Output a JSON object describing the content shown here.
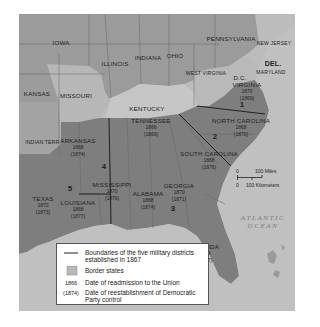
{
  "map": {
    "title": "Reconstruction military districts",
    "states": [
      {
        "name": "IOWA",
        "type": "union"
      },
      {
        "name": "ILLINOIS",
        "type": "union"
      },
      {
        "name": "INDIANA",
        "type": "union"
      },
      {
        "name": "OHIO",
        "type": "union"
      },
      {
        "name": "PENNSYLVANIA",
        "type": "union"
      },
      {
        "name": "NEW JERSEY",
        "type": "union"
      },
      {
        "name": "KANSAS",
        "type": "union"
      },
      {
        "name": "INDIAN TERR.",
        "type": "territory"
      },
      {
        "name": "MISSOURI",
        "type": "border"
      },
      {
        "name": "KENTUCKY",
        "type": "border"
      },
      {
        "name": "WEST VIRGINIA",
        "type": "border"
      },
      {
        "name": "MARYLAND",
        "type": "border"
      },
      {
        "name": "DEL.",
        "type": "border"
      },
      {
        "name": "D.C.",
        "type": "border"
      },
      {
        "name": "VIRGINIA",
        "type": "confederate",
        "readmitted": "1870",
        "democratic_control": "(1869)"
      },
      {
        "name": "NORTH CAROLINA",
        "type": "confederate",
        "readmitted": "1868",
        "democratic_control": "(1870)"
      },
      {
        "name": "SOUTH CAROLINA",
        "type": "confederate",
        "readmitted": "1868",
        "democratic_control": "(1876)"
      },
      {
        "name": "GEORGIA",
        "type": "confederate",
        "readmitted": "1870",
        "democratic_control": "(1871)"
      },
      {
        "name": "FLORIDA",
        "type": "confederate",
        "readmitted": "1868",
        "democratic_control": "(1877)"
      },
      {
        "name": "ALABAMA",
        "type": "confederate",
        "readmitted": "1868",
        "democratic_control": "(1874)"
      },
      {
        "name": "MISSISSIPPI",
        "type": "confederate",
        "readmitted": "1870",
        "democratic_control": "(1876)"
      },
      {
        "name": "TENNESSEE",
        "type": "confederate",
        "readmitted": "1866",
        "democratic_control": "(1869)"
      },
      {
        "name": "ARKANSAS",
        "type": "confederate",
        "readmitted": "1868",
        "democratic_control": "(1874)"
      },
      {
        "name": "LOUISIANA",
        "type": "confederate",
        "readmitted": "1868",
        "democratic_control": "(1877)"
      },
      {
        "name": "TEXAS",
        "type": "confederate",
        "readmitted": "1870",
        "democratic_control": "(1873)"
      }
    ],
    "districts": [
      "1",
      "2",
      "3",
      "4",
      "5"
    ],
    "ocean_label": [
      "ATLANTIC",
      "OCEAN"
    ],
    "scale": {
      "miles_zero": "0",
      "miles_label": "100 Miles",
      "km_zero": "0",
      "km_label": "100 Kilometers"
    }
  },
  "legend": {
    "items": [
      {
        "key": "—",
        "text": "Boundaries of the five military districts established in 1867"
      },
      {
        "key": "swatch",
        "text": "Border states"
      },
      {
        "key": "1866",
        "text": "Date of readmission to the Union"
      },
      {
        "key": "(1874)",
        "text": "Date of reestablishment of Democratic Party control"
      }
    ]
  },
  "colors": {
    "union": "#9d9d9d",
    "border": "#c4c4c4",
    "confederate": "#7f7f7f",
    "ocean": "#bdbdbd",
    "legend_bg": "#ffffff"
  }
}
